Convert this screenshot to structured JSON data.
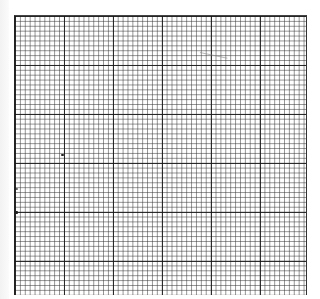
{
  "image": {
    "subject": "graph paper grid",
    "fine_cell_px": 4.9,
    "major_every_cells": 10,
    "colors": {
      "paper": "#ffffff",
      "minor_line": "#5a5a5a",
      "major_line": "#1a1a1a",
      "margin": "#f2f2f2"
    },
    "marks": [
      {
        "x": 62,
        "y": 155
      },
      {
        "x": 16,
        "y": 189
      },
      {
        "x": 16,
        "y": 212
      }
    ]
  }
}
